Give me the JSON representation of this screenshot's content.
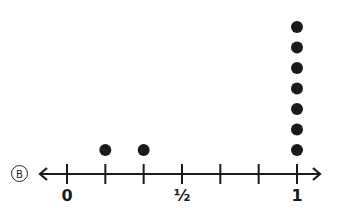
{
  "option": {
    "letter": "B"
  },
  "chart_data": {
    "type": "scatter",
    "subtype": "line plot / dot plot",
    "title": "",
    "xlabel": "",
    "ylabel": "",
    "axis": {
      "min": 0,
      "max": 1,
      "tick_step": "1/6",
      "ticks": [
        0,
        0.1667,
        0.3333,
        0.5,
        0.6667,
        0.8333,
        1
      ],
      "tick_labels": [
        {
          "value": 0,
          "label": "0"
        },
        {
          "value": 0.5,
          "label": "½"
        },
        {
          "value": 1,
          "label": "1"
        }
      ],
      "arrows": "both ends"
    },
    "categories": [
      "0",
      "1/6",
      "2/6",
      "3/6",
      "4/6",
      "5/6",
      "1"
    ],
    "values": [
      0,
      1,
      1,
      0,
      0,
      0,
      7
    ],
    "points": [
      {
        "x": "1/6",
        "count": 1
      },
      {
        "x": "2/6",
        "count": 1
      },
      {
        "x": "1",
        "count": 7
      }
    ],
    "grid": false,
    "legend": null
  },
  "labels": {
    "zero": "0",
    "half": "½",
    "one": "1"
  },
  "colors": {
    "ink": "#1a1a1a",
    "background": "#ffffff"
  }
}
